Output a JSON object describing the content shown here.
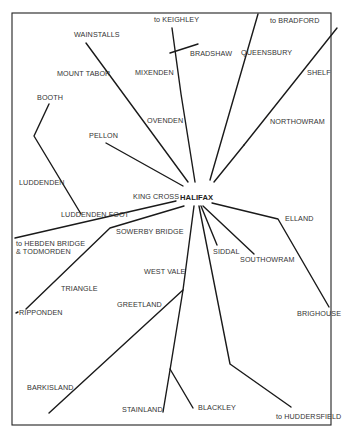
{
  "map": {
    "hub": "HALIFAX",
    "places": {
      "to_keighley": "to KEIGHLEY",
      "to_bradford": "to BRADFORD",
      "wainstalls": "WAINSTALLS",
      "bradshaw": "BRADSHAW",
      "queensbury": "QUEENSBURY",
      "mount_tabor": "MOUNT TABOR",
      "mixenden": "MIXENDEN",
      "shelf": "SHELF",
      "booth": "BOOTH",
      "ovenden": "OVENDEN",
      "northowram": "NORTHOWRAM",
      "pellon": "PELLON",
      "luddenden": "LUDDENDEN",
      "king_cross": "KING CROSS",
      "luddenden_foot": "LUDDENDEN FOOT",
      "elland": "ELLAND",
      "to_hebden_1": "to HEBDEN BRIDGE",
      "to_hebden_2": "& TODMORDEN",
      "sowerby_bridge": "SOWERBY BRIDGE",
      "siddal": "SIDDAL",
      "southowram": "SOUTHOWRAM",
      "west_vale": "WEST VALE",
      "triangle": "TRIANGLE",
      "greetland": "GREETLAND",
      "ripponden": "RIPPONDEN",
      "brighouse": "BRIGHOUSE",
      "barkisland": "BARKISLAND",
      "stainland": "STAINLAND",
      "blackley": "BLACKLEY",
      "to_huddersfield": "to HUDDERSFIELD"
    }
  }
}
